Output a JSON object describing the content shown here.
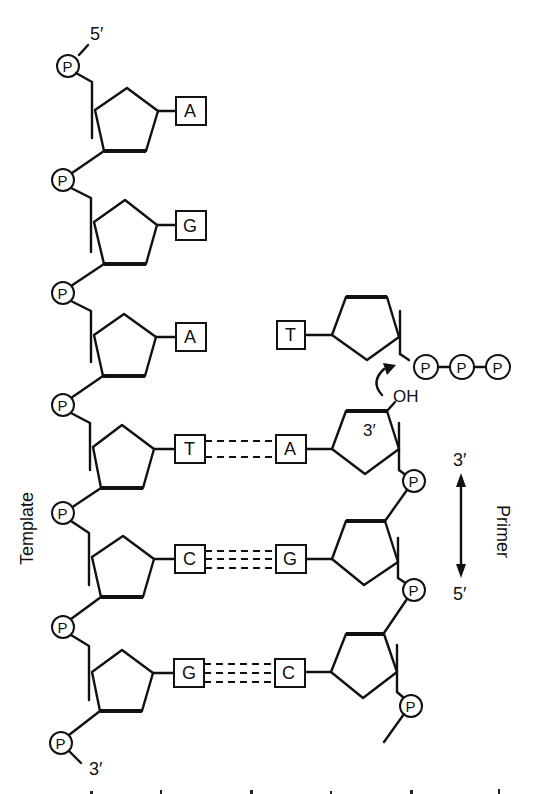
{
  "diagram": {
    "type": "DNA replication — primer extension on template",
    "labels": {
      "template": "Template",
      "primer": "Primer",
      "template_5prime": "5′",
      "template_3prime": "3′",
      "primer_3prime_arrow": "3′",
      "primer_5prime_arrow": "5′",
      "primer_3prime_sugar": "3′",
      "hydroxyl": "OH",
      "phosphate": "P"
    },
    "template_strand": {
      "bases": [
        "A",
        "G",
        "A",
        "T",
        "C",
        "G"
      ],
      "direction": "5′ to 3′ (top to bottom)"
    },
    "primer_strand": {
      "bases": [
        "A",
        "G",
        "C"
      ],
      "paired_with": [
        "T",
        "C",
        "G"
      ],
      "hydrogen_bonds": [
        2,
        3,
        3
      ]
    },
    "incoming_nucleotide": {
      "base": "T",
      "phosphates": [
        "P",
        "P",
        "P"
      ]
    }
  }
}
